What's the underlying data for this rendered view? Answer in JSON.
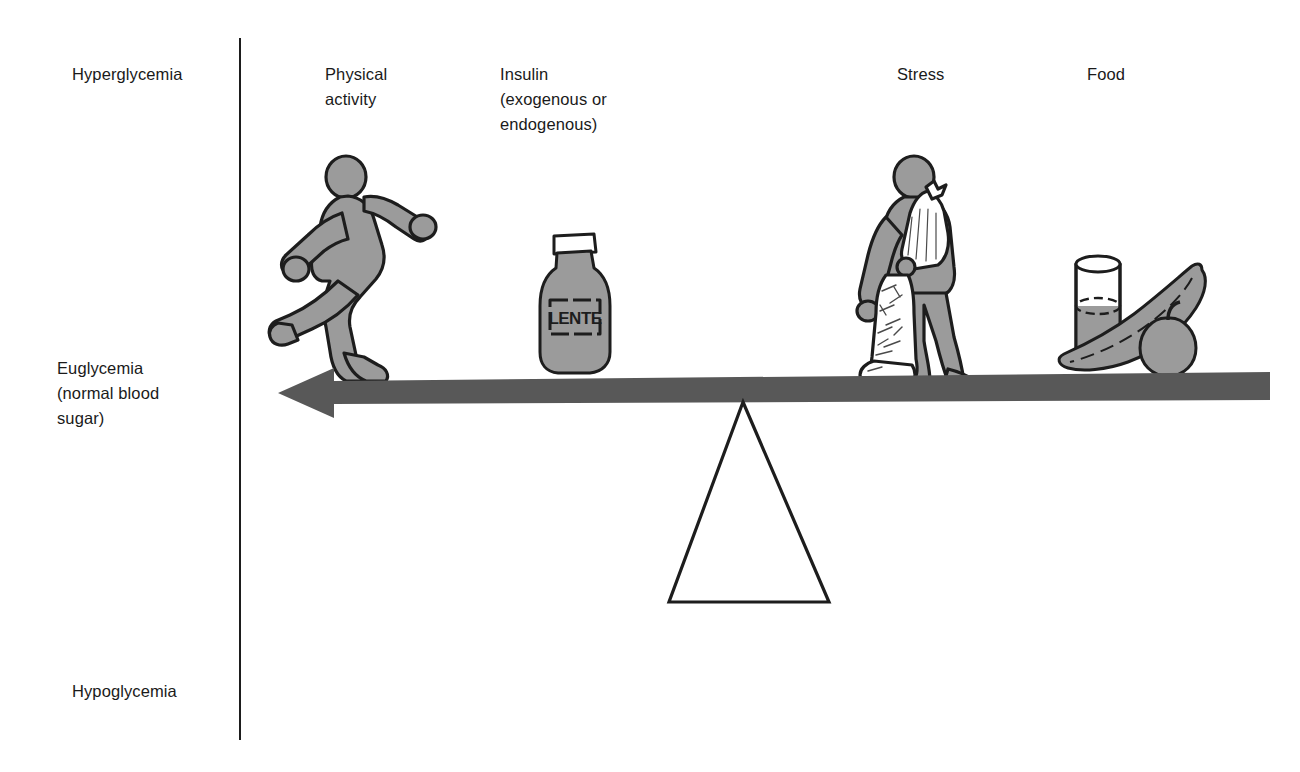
{
  "diagram": {
    "axis": {
      "name": "blood-glucose-axis",
      "levels": [
        {
          "id": "hyperglycemia",
          "label": "Hyperglycemia"
        },
        {
          "id": "euglycemia",
          "label": "Euglycemia\n(normal blood\nsugar)"
        },
        {
          "id": "hypoglycemia",
          "label": "Hypoglycemia"
        }
      ]
    },
    "factors": [
      {
        "id": "physical-activity",
        "label": "Physical\nactivity",
        "icon": "running-person-icon"
      },
      {
        "id": "insulin",
        "label": "Insulin\n(exogenous or\nendogenous)",
        "icon": "insulin-bottle-icon",
        "bottle_label": "LENTE"
      },
      {
        "id": "stress",
        "label": "Stress",
        "icon": "injured-person-icon"
      },
      {
        "id": "food",
        "label": "Food",
        "icon": "food-glass-banana-apple-icon"
      }
    ],
    "balance": {
      "beam_name": "balance-beam-arrow",
      "beam_direction": "left",
      "fulcrum_name": "fulcrum-triangle"
    },
    "colors": {
      "figure_fill": "#9b9b9b",
      "figure_outline": "#1d1d1d",
      "beam": "#585858",
      "axis": "#1d1d1d",
      "text": "#1a1a1a",
      "white": "#ffffff"
    }
  }
}
